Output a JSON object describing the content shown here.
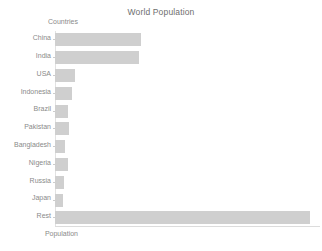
{
  "chart_data": {
    "type": "bar",
    "orientation": "horizontal",
    "title": "World Population",
    "xlabel": "Population",
    "ylabel": "Countries",
    "categories": [
      "China",
      "India",
      "USA",
      "Indonesia",
      "Brazil",
      "Pakistan",
      "Bangladesh",
      "Nigeria",
      "Russia",
      "Japan",
      "Rest"
    ],
    "values": [
      1412000000,
      1380000000,
      332000000,
      276000000,
      213000000,
      225000000,
      166000000,
      211000000,
      144000000,
      126000000,
      4200000000
    ],
    "bar_pixel_lengths": [
      118,
      108,
      30,
      22,
      18,
      18,
      14,
      14,
      14,
      14,
      255
    ],
    "xlim": [
      0,
      4350000000
    ],
    "grid": false,
    "legend": null,
    "bar_color": "#cfcfcf",
    "text_color": "#8a8a8a",
    "title_color": "#6e6e6e",
    "axis_color": "#dcdcdc"
  }
}
